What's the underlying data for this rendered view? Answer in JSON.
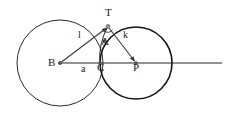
{
  "figure": {
    "background_color": "#ffffff",
    "stroke_color": "#1a1a1a",
    "ray_color": "#666666",
    "segment_color": "#4a4a4a"
  },
  "points": [
    {
      "id": "B",
      "label": "B",
      "x": 60,
      "y": 63,
      "label_x": 48,
      "label_y": 58,
      "marker": true,
      "role": "center-of-large-circle"
    },
    {
      "id": "C",
      "label": "C",
      "x": 100,
      "y": 63,
      "label_x": 96,
      "label_y": 64,
      "marker": true,
      "role": "intersection-on-axis"
    },
    {
      "id": "P",
      "label": "P",
      "x": 136,
      "y": 63,
      "label_x": 133,
      "label_y": 64,
      "marker": true,
      "role": "center-of-small-circle"
    },
    {
      "id": "T",
      "label": "T",
      "x": 108,
      "y": 26,
      "label_x": 105,
      "label_y": 9,
      "marker": true,
      "role": "upper-intersection-tangency"
    },
    {
      "id": "A",
      "label": "A",
      "x": 104,
      "y": 41,
      "label_x": 101,
      "label_y": 38,
      "marker": true,
      "role": "foot-point"
    }
  ],
  "segment_labels": [
    {
      "id": "l",
      "label": "l",
      "x": 79,
      "y": 33,
      "describes": "segment-B-to-T"
    },
    {
      "id": "k",
      "label": "k",
      "x": 124,
      "y": 33,
      "describes": "segment-T-to-P"
    },
    {
      "id": "a",
      "label": "a",
      "x": 81,
      "y": 67,
      "describes": "segment-B-to-C"
    }
  ],
  "circles": [
    {
      "id": "circle-B",
      "center": "B",
      "cx": 60,
      "cy": 63,
      "r": 43,
      "stroke_width": 1.0,
      "color": "#2b2b2b"
    },
    {
      "id": "circle-P",
      "center": "P",
      "cx": 136,
      "cy": 63,
      "r": 36,
      "stroke_width": 1.6,
      "color": "#141414"
    }
  ],
  "lines": [
    {
      "id": "axis-ray",
      "from_x": 58,
      "from_y": 63,
      "to_x": 222,
      "to_y": 63,
      "color": "#6e6e6e",
      "stroke_width": 1.4,
      "arrow": false
    },
    {
      "id": "segment-BT",
      "from_x": 60,
      "from_y": 63,
      "to_x": 108,
      "to_y": 27,
      "color": "#3a3a3a",
      "stroke_width": 1.1,
      "arrow": true
    },
    {
      "id": "segment-TP",
      "from_x": 108,
      "from_y": 27,
      "to_x": 136,
      "to_y": 62,
      "color": "#3a3a3a",
      "stroke_width": 1.1,
      "arrow": true
    }
  ],
  "right_angle_marker": {
    "id": "right-angle-at-T",
    "cx": 108,
    "cy": 27,
    "radius": 5,
    "color": "#3a3a3a"
  }
}
